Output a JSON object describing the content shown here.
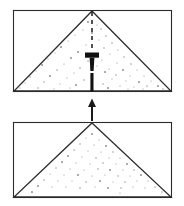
{
  "figure": {
    "background_color": "#ffffff",
    "line_color": "#2b2b2b",
    "stipple_color": "#8a8a8a",
    "solid_fill_color": "#111111",
    "canvas": {
      "width": 184,
      "height": 206
    }
  },
  "panels": [
    {
      "id": "upper-panel",
      "label": "upper frame",
      "frame": {
        "x": 13,
        "y": 10,
        "width": 159,
        "height": 82
      },
      "triangle": {
        "apex": {
          "x": 92,
          "y": 11
        },
        "left_base": {
          "x": 14,
          "y": 91
        },
        "right_base": {
          "x": 171,
          "y": 91
        },
        "fill": "stipple"
      },
      "centerline": {
        "type": "dashed",
        "x": 92,
        "y_start": 12,
        "y_end": 52,
        "dash_pattern": "4 4"
      },
      "wedge": {
        "name": "nail",
        "head": {
          "x": 85,
          "y": 53,
          "width": 14,
          "height": 5
        },
        "shank_top": {
          "x": 90,
          "y": 58,
          "width": 4,
          "height": 13
        },
        "shank_bottom": {
          "x": 90.5,
          "y": 73,
          "width": 3,
          "height": 18
        },
        "tip_y": 91
      },
      "stipple_count": 64
    },
    {
      "id": "lower-panel",
      "label": "lower frame",
      "frame": {
        "x": 13,
        "y": 122,
        "width": 159,
        "height": 76
      },
      "triangle": {
        "apex": {
          "x": 92,
          "y": 123
        },
        "left_base": {
          "x": 14,
          "y": 197
        },
        "right_base": {
          "x": 171,
          "y": 197
        },
        "fill": "stipple"
      },
      "centerline": null,
      "wedge": null,
      "stipple_count": 58
    }
  ],
  "arrow": {
    "name": "process-arrow",
    "direction": "up",
    "x": 92,
    "y_tail": 120,
    "y_head": 99,
    "head_width": 7,
    "head_length": 8
  },
  "stipple_upper": [
    [
      88,
      22
    ],
    [
      97,
      25
    ],
    [
      83,
      30
    ],
    [
      101,
      29
    ],
    [
      75,
      35
    ],
    [
      92,
      33
    ],
    [
      106,
      36
    ],
    [
      68,
      41
    ],
    [
      99,
      40
    ],
    [
      112,
      43
    ],
    [
      61,
      47
    ],
    [
      86,
      45
    ],
    [
      104,
      48
    ],
    [
      118,
      50
    ],
    [
      55,
      53
    ],
    [
      78,
      52
    ],
    [
      95,
      55
    ],
    [
      110,
      54
    ],
    [
      124,
      57
    ],
    [
      48,
      59
    ],
    [
      71,
      58
    ],
    [
      88,
      61
    ],
    [
      102,
      60
    ],
    [
      117,
      63
    ],
    [
      131,
      64
    ],
    [
      42,
      65
    ],
    [
      64,
      64
    ],
    [
      80,
      68
    ],
    [
      97,
      66
    ],
    [
      109,
      69
    ],
    [
      123,
      70
    ],
    [
      137,
      70
    ],
    [
      36,
      71
    ],
    [
      57,
      70
    ],
    [
      74,
      73
    ],
    [
      105,
      72
    ],
    [
      116,
      75
    ],
    [
      130,
      76
    ],
    [
      144,
      76
    ],
    [
      30,
      77
    ],
    [
      50,
      76
    ],
    [
      67,
      78
    ],
    [
      84,
      80
    ],
    [
      112,
      79
    ],
    [
      126,
      81
    ],
    [
      139,
      82
    ],
    [
      151,
      81
    ],
    [
      25,
      83
    ],
    [
      44,
      82
    ],
    [
      60,
      84
    ],
    [
      76,
      85
    ],
    [
      103,
      84
    ],
    [
      120,
      86
    ],
    [
      134,
      87
    ],
    [
      147,
      86
    ],
    [
      158,
      86
    ],
    [
      20,
      88
    ],
    [
      38,
      88
    ],
    [
      54,
      89
    ],
    [
      70,
      88
    ],
    [
      108,
      88
    ],
    [
      128,
      89
    ],
    [
      143,
      89
    ],
    [
      163,
      89
    ]
  ],
  "stipple_lower": [
    [
      92,
      134
    ],
    [
      86,
      138
    ],
    [
      99,
      140
    ],
    [
      80,
      144
    ],
    [
      94,
      145
    ],
    [
      106,
      146
    ],
    [
      74,
      150
    ],
    [
      88,
      151
    ],
    [
      101,
      152
    ],
    [
      113,
      152
    ],
    [
      68,
      156
    ],
    [
      82,
      157
    ],
    [
      96,
      158
    ],
    [
      109,
      158
    ],
    [
      120,
      158
    ],
    [
      62,
      162
    ],
    [
      76,
      163
    ],
    [
      90,
      164
    ],
    [
      103,
      163
    ],
    [
      116,
      164
    ],
    [
      127,
      164
    ],
    [
      56,
      168
    ],
    [
      70,
      169
    ],
    [
      84,
      170
    ],
    [
      98,
      169
    ],
    [
      110,
      170
    ],
    [
      123,
      170
    ],
    [
      134,
      170
    ],
    [
      50,
      174
    ],
    [
      64,
      175
    ],
    [
      78,
      175
    ],
    [
      92,
      176
    ],
    [
      105,
      175
    ],
    [
      118,
      176
    ],
    [
      130,
      176
    ],
    [
      141,
      175
    ],
    [
      44,
      180
    ],
    [
      58,
      181
    ],
    [
      72,
      181
    ],
    [
      86,
      182
    ],
    [
      100,
      181
    ],
    [
      113,
      182
    ],
    [
      125,
      182
    ],
    [
      137,
      181
    ],
    [
      148,
      181
    ],
    [
      38,
      186
    ],
    [
      52,
      187
    ],
    [
      66,
      187
    ],
    [
      80,
      188
    ],
    [
      95,
      187
    ],
    [
      108,
      188
    ],
    [
      121,
      188
    ],
    [
      133,
      187
    ],
    [
      145,
      188
    ],
    [
      155,
      187
    ],
    [
      32,
      192
    ],
    [
      120,
      193
    ],
    [
      162,
      192
    ]
  ]
}
